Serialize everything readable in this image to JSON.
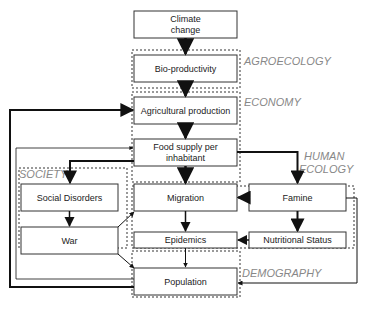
{
  "diagram": {
    "type": "flowchart",
    "zones": [
      {
        "id": "agroecology",
        "label": "AGROECOLOGY"
      },
      {
        "id": "economy",
        "label": "ECONOMY"
      },
      {
        "id": "human_ecology",
        "label_line1": "HUMAN",
        "label_line2": "ECOLOGY"
      },
      {
        "id": "society",
        "label": "SOCIETY"
      },
      {
        "id": "demography",
        "label": "DEMOGRAPHY"
      }
    ],
    "nodes": {
      "climate": {
        "line1": "Climate",
        "line2": "change"
      },
      "bio": {
        "label": "Bio-productivity"
      },
      "agri": {
        "label": "Agricultural production"
      },
      "food": {
        "line1": "Food supply per",
        "line2": "inhabitant"
      },
      "social": {
        "label": "Social Disorders"
      },
      "war": {
        "label": "War"
      },
      "migration": {
        "label": "Migration"
      },
      "famine": {
        "label": "Famine"
      },
      "epidemics": {
        "label": "Epidemics"
      },
      "nutrition": {
        "label": "Nutritional Status"
      },
      "population": {
        "label": "Population"
      }
    },
    "edges": [
      {
        "from": "Climate change",
        "to": "Bio-productivity"
      },
      {
        "from": "Bio-productivity",
        "to": "Agricultural production"
      },
      {
        "from": "Agricultural production",
        "to": "Food supply per inhabitant"
      },
      {
        "from": "Food supply per inhabitant",
        "to": "Migration"
      },
      {
        "from": "Food supply per inhabitant",
        "to": "Social Disorders"
      },
      {
        "from": "Food supply per inhabitant",
        "to": "Famine"
      },
      {
        "from": "Social Disorders",
        "to": "War"
      },
      {
        "from": "War",
        "to": "Migration"
      },
      {
        "from": "War",
        "to": "Population"
      },
      {
        "from": "Famine",
        "to": "Migration"
      },
      {
        "from": "Famine",
        "to": "Nutritional Status"
      },
      {
        "from": "Famine",
        "to": "Population"
      },
      {
        "from": "Nutritional Status",
        "to": "Epidemics"
      },
      {
        "from": "Migration",
        "to": "Epidemics"
      },
      {
        "from": "Epidemics",
        "to": "Population"
      },
      {
        "from": "Population",
        "to": "Agricultural production"
      },
      {
        "from": "Population",
        "to": "Food supply per inhabitant"
      }
    ],
    "colors": {
      "box_stroke": "#333333",
      "zone_dots": "#999999",
      "zone_label": "#888888",
      "arrow": "#111111"
    }
  }
}
